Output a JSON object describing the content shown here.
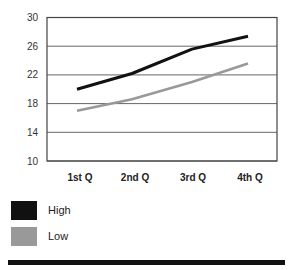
{
  "chart_data": {
    "type": "line",
    "title": "",
    "xlabel": "",
    "ylabel": "",
    "categories": [
      "1st Q",
      "2nd Q",
      "3rd Q",
      "4th Q"
    ],
    "series": [
      {
        "name": "High",
        "color": "#111111",
        "values": [
          20,
          22.2,
          25.6,
          27.4
        ]
      },
      {
        "name": "Low",
        "color": "#999999",
        "values": [
          17,
          18.6,
          21,
          23.6
        ]
      }
    ],
    "ylim": [
      10,
      30
    ],
    "yticks": [
      "30",
      "26",
      "22",
      "18",
      "14",
      "10"
    ],
    "grid": true,
    "legend_position": "bottom-left"
  },
  "legend": {
    "items": [
      {
        "label": "High",
        "color": "#111111"
      },
      {
        "label": "Low",
        "color": "#999999"
      }
    ]
  }
}
